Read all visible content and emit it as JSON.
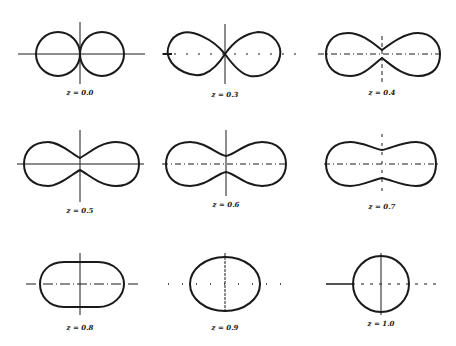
{
  "figure": {
    "panels": [
      {
        "label": "z = 0.0",
        "value": 0.0
      },
      {
        "label": "z = 0.3",
        "value": 0.3
      },
      {
        "label": "z = 0.4",
        "value": 0.4
      },
      {
        "label": "z = 0.5",
        "value": 0.5
      },
      {
        "label": "z = 0.6",
        "value": 0.6
      },
      {
        "label": "z = 0.7",
        "value": 0.7
      },
      {
        "label": "z = 0.8",
        "value": 0.8
      },
      {
        "label": "z = 0.9",
        "value": 0.9
      },
      {
        "label": "z = 1.0",
        "value": 1.0
      }
    ],
    "colors": {
      "stroke": "#1a1a1a",
      "background": "#ffffff"
    }
  }
}
